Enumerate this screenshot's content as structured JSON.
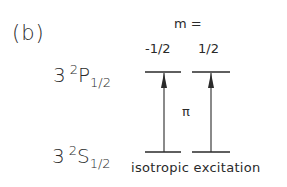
{
  "panel_label": "(b)",
  "m_header": "m =",
  "m_values": [
    "-1/2",
    "1/2"
  ],
  "states": {
    "upper": {
      "n": "3",
      "mult": "2",
      "L": "P",
      "J": "1/2"
    },
    "lower": {
      "n": "3",
      "mult": "2",
      "L": "S",
      "J": "1/2"
    }
  },
  "transition_label": "π",
  "caption": "isotropic excitation",
  "colors": {
    "ink": "#2a2a2a",
    "background": "#ffffff"
  }
}
